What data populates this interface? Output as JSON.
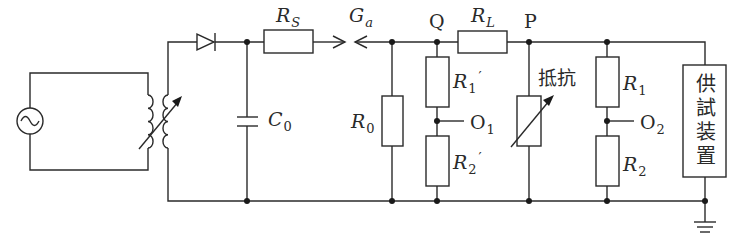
{
  "diagram": {
    "type": "circuit",
    "labels": {
      "rs": {
        "main": "R",
        "sub": "S"
      },
      "ga": {
        "main": "G",
        "sub": "a"
      },
      "c0": {
        "main": "C",
        "sub": "0"
      },
      "r0": {
        "main": "R",
        "sub": "0"
      },
      "q": "Q",
      "p": "P",
      "rl": {
        "main": "R",
        "sub": "L"
      },
      "r1p": {
        "main": "R",
        "sub": "1",
        "prime": "′"
      },
      "r2p": {
        "main": "R",
        "sub": "2",
        "prime": "′"
      },
      "o1": {
        "main": "O",
        "sub": "1"
      },
      "resistor": "抵抗",
      "r1": {
        "main": "R",
        "sub": "1"
      },
      "r2": {
        "main": "R",
        "sub": "2"
      },
      "o2": {
        "main": "O",
        "sub": "2"
      },
      "device": "供試装置"
    },
    "components": [
      {
        "id": "ac-source",
        "symbol": "ac-voltage-source"
      },
      {
        "id": "variable-transformer",
        "symbol": "variable-transformer"
      },
      {
        "id": "diode",
        "symbol": "diode"
      },
      {
        "id": "C0",
        "symbol": "capacitor"
      },
      {
        "id": "RS",
        "symbol": "resistor"
      },
      {
        "id": "Ga",
        "symbol": "spark-gap"
      },
      {
        "id": "R0",
        "symbol": "resistor"
      },
      {
        "id": "RL",
        "symbol": "resistor"
      },
      {
        "id": "R1prime",
        "symbol": "resistor"
      },
      {
        "id": "R2prime",
        "symbol": "resistor"
      },
      {
        "id": "variable-resistor",
        "symbol": "variable-resistor"
      },
      {
        "id": "R1",
        "symbol": "resistor"
      },
      {
        "id": "R2",
        "symbol": "resistor"
      },
      {
        "id": "test-device",
        "symbol": "box"
      },
      {
        "id": "ground",
        "symbol": "ground"
      }
    ],
    "colors": {
      "line": "#2a2a2a",
      "background": "#ffffff"
    }
  }
}
